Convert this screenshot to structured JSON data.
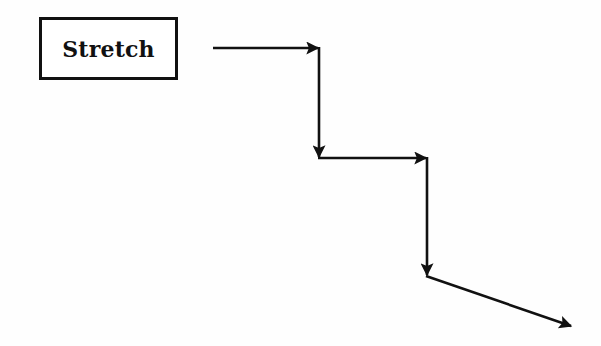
{
  "diagram": {
    "node": {
      "label": "Stretch"
    },
    "stroke_color": "#111111",
    "background_color": "#fefefe",
    "path": {
      "description": "Staircase of arrows descending to the right from the Stretch box",
      "segments": [
        {
          "from": [
            213,
            48
          ],
          "to": [
            319,
            48
          ],
          "direction": "right"
        },
        {
          "from": [
            319,
            48
          ],
          "to": [
            319,
            158
          ],
          "direction": "down"
        },
        {
          "from": [
            319,
            158
          ],
          "to": [
            427,
            158
          ],
          "direction": "right"
        },
        {
          "from": [
            427,
            158
          ],
          "to": [
            427,
            276
          ],
          "direction": "down"
        },
        {
          "from": [
            427,
            276
          ],
          "to": [
            572,
            326
          ],
          "direction": "down-right"
        }
      ]
    }
  }
}
